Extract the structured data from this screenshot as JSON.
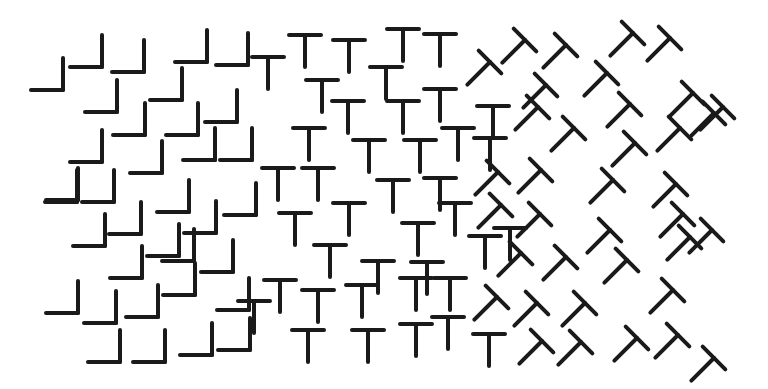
{
  "figure": {
    "title": "Texture segregation stimulus: L shapes, upright Ts, tilted Ts",
    "ink_color": "#1a1a1a",
    "background": "#ffffff",
    "stroke_width": 4,
    "arm_length": 32,
    "regions": [
      {
        "name": "left",
        "element": "L"
      },
      {
        "name": "middle",
        "element": "T-upright"
      },
      {
        "name": "right",
        "element": "T-tilted-45"
      }
    ],
    "L_shapes": [
      [
        63,
        90
      ],
      [
        102,
        67
      ],
      [
        144,
        72
      ],
      [
        207,
        62
      ],
      [
        248,
        65
      ],
      [
        117,
        112
      ],
      [
        182,
        100
      ],
      [
        237,
        122
      ],
      [
        102,
        162
      ],
      [
        145,
        135
      ],
      [
        198,
        135
      ],
      [
        252,
        160
      ],
      [
        78,
        200
      ],
      [
        162,
        173
      ],
      [
        215,
        160
      ],
      [
        77,
        202
      ],
      [
        114,
        202
      ],
      [
        189,
        212
      ],
      [
        256,
        215
      ],
      [
        105,
        246
      ],
      [
        141,
        234
      ],
      [
        179,
        256
      ],
      [
        216,
        233
      ],
      [
        142,
        278
      ],
      [
        194,
        261
      ],
      [
        233,
        272
      ],
      [
        78,
        313
      ],
      [
        116,
        323
      ],
      [
        158,
        317
      ],
      [
        195,
        295
      ],
      [
        249,
        310
      ],
      [
        120,
        362
      ],
      [
        165,
        362
      ],
      [
        212,
        355
      ],
      [
        250,
        350
      ]
    ],
    "T_upright": [
      [
        268,
        57
      ],
      [
        305,
        35
      ],
      [
        349,
        40
      ],
      [
        403,
        29
      ],
      [
        440,
        34
      ],
      [
        386,
        67
      ],
      [
        322,
        80
      ],
      [
        348,
        101
      ],
      [
        403,
        101
      ],
      [
        440,
        89
      ],
      [
        493,
        106
      ],
      [
        309,
        128
      ],
      [
        369,
        140
      ],
      [
        420,
        140
      ],
      [
        458,
        128
      ],
      [
        278,
        168
      ],
      [
        318,
        168
      ],
      [
        393,
        180
      ],
      [
        440,
        178
      ],
      [
        490,
        138
      ],
      [
        295,
        213
      ],
      [
        349,
        203
      ],
      [
        418,
        223
      ],
      [
        455,
        203
      ],
      [
        510,
        228
      ],
      [
        330,
        245
      ],
      [
        378,
        261
      ],
      [
        427,
        262
      ],
      [
        485,
        236
      ],
      [
        280,
        280
      ],
      [
        318,
        290
      ],
      [
        362,
        285
      ],
      [
        416,
        278
      ],
      [
        450,
        278
      ],
      [
        254,
        301
      ],
      [
        308,
        330
      ],
      [
        368,
        330
      ],
      [
        416,
        324
      ],
      [
        448,
        317
      ],
      [
        489,
        334
      ]
    ],
    "T_tilted": [
      [
        490,
        62
      ],
      [
        525,
        40
      ],
      [
        566,
        45
      ],
      [
        633,
        33
      ],
      [
        670,
        38
      ],
      [
        546,
        85
      ],
      [
        607,
        73
      ],
      [
        538,
        107
      ],
      [
        630,
        104
      ],
      [
        693,
        93
      ],
      [
        714,
        113
      ],
      [
        574,
        128
      ],
      [
        635,
        143
      ],
      [
        680,
        128
      ],
      [
        723,
        107
      ],
      [
        498,
        172
      ],
      [
        541,
        170
      ],
      [
        613,
        180
      ],
      [
        676,
        184
      ],
      [
        501,
        205
      ],
      [
        540,
        214
      ],
      [
        610,
        230
      ],
      [
        683,
        214
      ],
      [
        712,
        230
      ],
      [
        521,
        253
      ],
      [
        566,
        257
      ],
      [
        627,
        260
      ],
      [
        690,
        237
      ],
      [
        497,
        297
      ],
      [
        537,
        303
      ],
      [
        585,
        303
      ],
      [
        673,
        290
      ],
      [
        542,
        341
      ],
      [
        581,
        342
      ],
      [
        637,
        338
      ],
      [
        678,
        335
      ],
      [
        714,
        358
      ]
    ]
  }
}
